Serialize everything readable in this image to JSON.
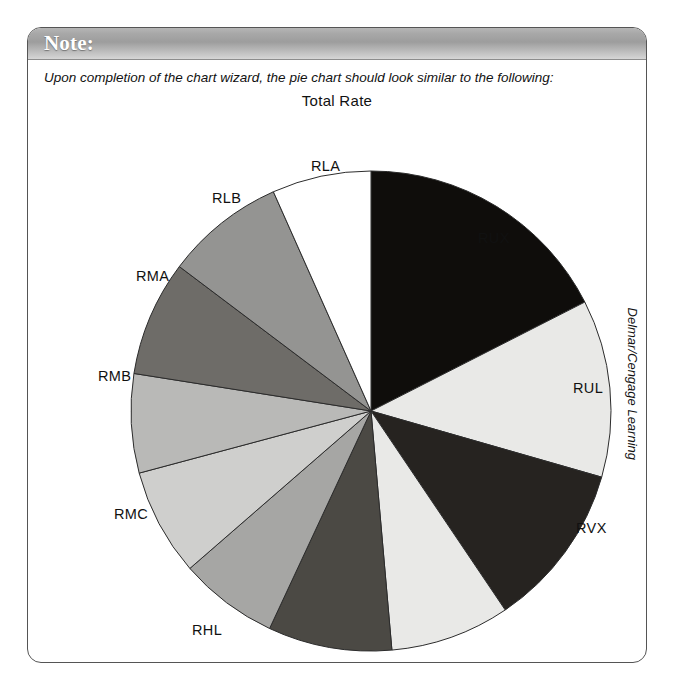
{
  "note": {
    "header_title": "Note:",
    "caption": "Upon completion of the chart wizard, the pie chart should look similar to the following:"
  },
  "credit": "Delmar/Cengage Learning",
  "chart_data": {
    "type": "pie",
    "title": "Total Rate",
    "xlabel": "",
    "ylabel": "",
    "legend_position": "none",
    "grid": false,
    "start_angle_deg": 0,
    "direction": "clockwise",
    "categories": [
      "RUX",
      "RUL",
      "RVX",
      "RVL",
      "RHX",
      "RHL",
      "RMC",
      "RMB",
      "RMA",
      "RLB",
      "RLA"
    ],
    "values": [
      63,
      43,
      40,
      29,
      30,
      24,
      26,
      24,
      28,
      29,
      24
    ],
    "slices": [
      {
        "label": "RUX",
        "value": 63,
        "start_deg": 0,
        "end_deg": 63,
        "color": "#0f0d0b"
      },
      {
        "label": "RUL",
        "value": 43,
        "start_deg": 63,
        "end_deg": 106,
        "color": "#e9e9e7"
      },
      {
        "label": "RVX",
        "value": 40,
        "start_deg": 106,
        "end_deg": 146,
        "color": "#262320"
      },
      {
        "label": "RVL",
        "value": 29,
        "start_deg": 146,
        "end_deg": 175,
        "color": "#e9e9e7"
      },
      {
        "label": "RHX",
        "value": 30,
        "start_deg": 175,
        "end_deg": 205,
        "color": "#4b4944"
      },
      {
        "label": "RHL",
        "value": 24,
        "start_deg": 205,
        "end_deg": 229,
        "color": "#a6a6a4"
      },
      {
        "label": "RMC",
        "value": 26,
        "start_deg": 229,
        "end_deg": 255,
        "color": "#cfcfcd"
      },
      {
        "label": "RMB",
        "value": 24,
        "start_deg": 255,
        "end_deg": 279,
        "color": "#b9b9b7"
      },
      {
        "label": "RMA",
        "value": 28,
        "start_deg": 279,
        "end_deg": 307,
        "color": "#6e6c68"
      },
      {
        "label": "RLB",
        "value": 29,
        "start_deg": 307,
        "end_deg": 336,
        "color": "#949492"
      },
      {
        "label": "RLA",
        "value": 24,
        "start_deg": 336,
        "end_deg": 360,
        "color": "#ffffff"
      }
    ],
    "label_positions": [
      {
        "label": "RUX",
        "x": 450,
        "y": 138
      },
      {
        "label": "RUL",
        "x": 545,
        "y": 288
      },
      {
        "label": "RVX",
        "x": 548,
        "y": 428
      },
      {
        "label": "RVL",
        "x": 462,
        "y": 568
      },
      {
        "label": "RHX",
        "x": 306,
        "y": 604
      },
      {
        "label": "RHL",
        "x": 164,
        "y": 530
      },
      {
        "label": "RMC",
        "x": 86,
        "y": 414
      },
      {
        "label": "RMB",
        "x": 70,
        "y": 276
      },
      {
        "label": "RMA",
        "x": 108,
        "y": 176
      },
      {
        "label": "RLB",
        "x": 184,
        "y": 98
      },
      {
        "label": "RLA",
        "x": 283,
        "y": 66
      }
    ],
    "geometry": {
      "cx": 343,
      "cy": 319,
      "r": 240
    }
  }
}
